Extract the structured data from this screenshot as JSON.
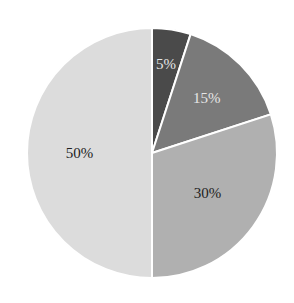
{
  "chart_data": {
    "type": "pie",
    "title": "",
    "categories": [
      "A",
      "B",
      "C",
      "D"
    ],
    "values": [
      5,
      15,
      30,
      50
    ],
    "labels": [
      "5%",
      "15%",
      "30%",
      "50%"
    ],
    "colors": [
      "#4a4a4a",
      "#7a7a7a",
      "#b0b0b0",
      "#dcdcdc"
    ],
    "label_colors": [
      "#e6e6e6",
      "#e6e6e6",
      "#222222",
      "#222222"
    ],
    "start_angle_deg": 0,
    "direction": "clockwise",
    "legend": "none"
  }
}
